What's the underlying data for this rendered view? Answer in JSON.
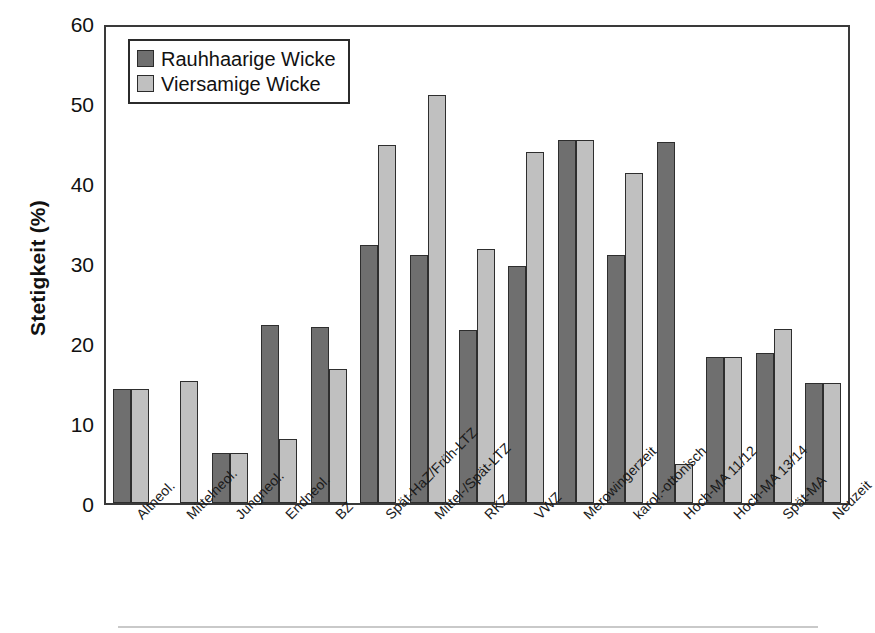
{
  "chart_data": {
    "type": "bar",
    "title": "",
    "xlabel": "",
    "ylabel": "Stetigkeit (%)",
    "ylim": [
      0,
      60
    ],
    "yticks": [
      0,
      10,
      20,
      30,
      40,
      50,
      60
    ],
    "ytick_labels": [
      "0",
      "10",
      "20",
      "30",
      "40",
      "50",
      "60"
    ],
    "grid": false,
    "legend_position": "upper-left-inside",
    "categories": [
      "Altneol.",
      "Mittelneol.",
      "Jungneol.",
      "Endneol.",
      "BZ",
      "Spät-HaZ/Früh-LTZ",
      "Mittel-/Spät-LTZ",
      "RKZ",
      "VWZ",
      "Merowingerzeit",
      "karol.-ottonisch",
      "Hoch-MA 11/12",
      "Hoch-MA 13/14",
      "Spät-MA",
      "Neuzeit"
    ],
    "series": [
      {
        "name": "Rauhhaarige Wicke",
        "color": "#6f6f6f",
        "values": [
          14.2,
          0,
          6.3,
          22.2,
          22.0,
          32.2,
          31.0,
          21.6,
          29.6,
          45.4,
          31.0,
          45.1,
          18.3,
          18.8,
          15.0
        ]
      },
      {
        "name": "Viersamige Wicke",
        "color": "#c0c0c0",
        "values": [
          14.2,
          15.2,
          6.3,
          8.0,
          16.8,
          44.7,
          51.0,
          31.8,
          43.9,
          45.4,
          41.2,
          4.9,
          18.3,
          21.7,
          15.0
        ]
      }
    ]
  },
  "legend": {
    "items": [
      {
        "label": "Rauhhaarige Wicke",
        "color": "#6f6f6f"
      },
      {
        "label": "Viersamige Wicke",
        "color": "#c0c0c0"
      }
    ]
  }
}
